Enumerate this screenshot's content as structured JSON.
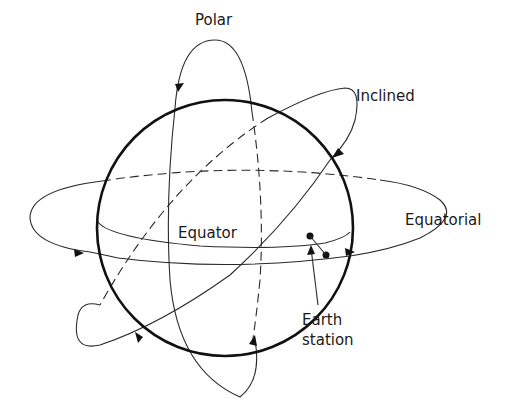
{
  "figure": {
    "type": "satellite-orbit-types-diagram",
    "labels": {
      "polar": "Polar",
      "inclined": "Inclined",
      "equatorial": "Equatorial",
      "equator": "Equator",
      "earth_station_line1": "Earth",
      "earth_station_line2": "station"
    },
    "colors": {
      "stroke": "#111111",
      "background": "#ffffff"
    },
    "orbits": [
      "Polar",
      "Inclined",
      "Equatorial"
    ]
  }
}
